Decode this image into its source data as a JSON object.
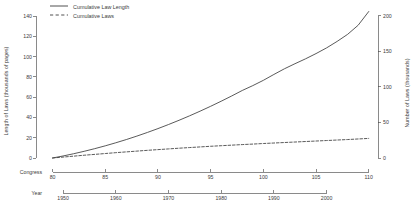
{
  "chart_data": {
    "type": "line",
    "title": "",
    "background": "#ffffff",
    "line_color": "#3c3c3c",
    "grid": false,
    "legend": {
      "position": "top-left",
      "entries": [
        {
          "label": "Cumulative Law Length",
          "style": "solid"
        },
        {
          "label": "Cumulative Laws",
          "style": "dashed"
        }
      ]
    },
    "axes": {
      "y_left": {
        "label": "Length of Laws (thousands of pages)",
        "ticks": [
          0,
          20,
          40,
          60,
          80,
          100,
          120,
          140
        ],
        "lim": [
          0,
          145
        ]
      },
      "y_right": {
        "label": "Number of Laws (thousands)",
        "ticks": [
          0,
          50,
          100,
          150,
          200
        ],
        "lim": [
          0,
          207
        ]
      },
      "x_congress": {
        "label": "Congress",
        "ticks": [
          80,
          85,
          90,
          95,
          100,
          105,
          110
        ],
        "lim": [
          79,
          110.5
        ]
      },
      "x_year": {
        "label": "Year",
        "ticks": [
          1950,
          1960,
          1970,
          1980,
          1990,
          2000
        ],
        "lim": [
          1946,
          2009
        ]
      }
    },
    "x": [
      80,
      81,
      82,
      83,
      84,
      85,
      86,
      87,
      88,
      89,
      90,
      91,
      92,
      93,
      94,
      95,
      96,
      97,
      98,
      99,
      100,
      101,
      102,
      103,
      104,
      105,
      106,
      107,
      108,
      109,
      110
    ],
    "series": [
      {
        "name": "Cumulative Law Length",
        "style": "solid",
        "axis": "left",
        "units": "thousands of pages",
        "values": [
          0,
          2.0,
          4.2,
          6.6,
          9.2,
          12.0,
          15.0,
          18.2,
          21.6,
          25.2,
          29.0,
          33.0,
          37.2,
          41.6,
          46.2,
          51.0,
          56.0,
          61.2,
          66.6,
          71.4,
          76.6,
          82.4,
          88.0,
          93.0,
          97.8,
          103.0,
          108.6,
          115.0,
          122.0,
          131.0,
          144.5
        ]
      },
      {
        "name": "Cumulative Laws",
        "style": "dashed",
        "axis": "right",
        "units": "thousands",
        "values": [
          0,
          1.3,
          2.6,
          3.9,
          5.1,
          6.3,
          7.5,
          8.6,
          9.7,
          10.8,
          11.8,
          12.8,
          13.8,
          14.7,
          15.6,
          16.5,
          17.3,
          18.1,
          18.9,
          19.6,
          20.4,
          21.1,
          21.8,
          22.5,
          23.2,
          23.9,
          24.6,
          25.3,
          26.0,
          26.8,
          27.6
        ]
      }
    ]
  }
}
